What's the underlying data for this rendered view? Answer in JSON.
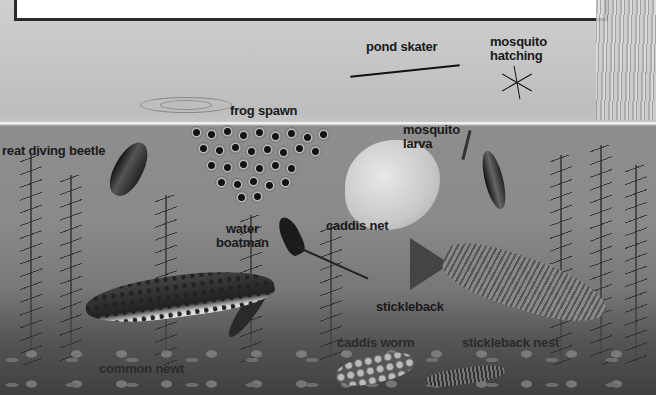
{
  "diagram": {
    "title_box": "",
    "style": "black-and-white illustrated pond cross-section",
    "colors": {
      "label": "#1a1a1a",
      "water_line": "#f0f0f0",
      "title_box_fill": "#ffffff",
      "title_box_border": "#2a2a2a"
    }
  },
  "labels": {
    "pond_skater": "pond skater",
    "mosquito_hatching": "mosquito\nhatching",
    "frog_spawn": "frog spawn",
    "mosquito_larva": "mosquito\nlarva",
    "great_diving_beetle": "reat diving beetle",
    "water_boatman": "water\nboatman",
    "caddis_net": "caddis net",
    "stickleback": "stickleback",
    "caddis_worm": "caddis worm",
    "stickleback_nest": "stickleback nest",
    "common_newt": "common newt"
  }
}
